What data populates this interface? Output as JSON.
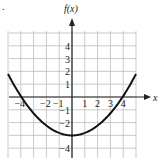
{
  "figure": {
    "corner_mark": ".",
    "y_axis_label": "f(x)",
    "x_axis_label": "x"
  },
  "chart_data": {
    "type": "line",
    "title": "",
    "xlabel": "x",
    "ylabel": "f(x)",
    "xlim": [
      -5,
      5
    ],
    "ylim": [
      -4.7,
      5
    ],
    "grid": true,
    "x_tick_labels": [
      "-4",
      "-2",
      "-1",
      "1",
      "2",
      "3",
      "4"
    ],
    "y_tick_labels": [
      "4",
      "3",
      "2",
      "1",
      "-1",
      "-2",
      "-4"
    ],
    "series": [
      {
        "name": "f(x)",
        "description": "upward-opening parabola, vertex (0,-3), zeros near x=±3.8",
        "x": [
          -5,
          -4,
          -3,
          -2,
          -1,
          0,
          1,
          2,
          3,
          4,
          5
        ],
        "y": [
          1.8,
          0.3,
          -0.9,
          -2.0,
          -2.75,
          -3.0,
          -2.75,
          -2.0,
          -0.9,
          0.3,
          1.8
        ]
      }
    ],
    "colors": {
      "curve": "#111111",
      "grid": "#bdbdbd",
      "axis": "#222222"
    }
  }
}
